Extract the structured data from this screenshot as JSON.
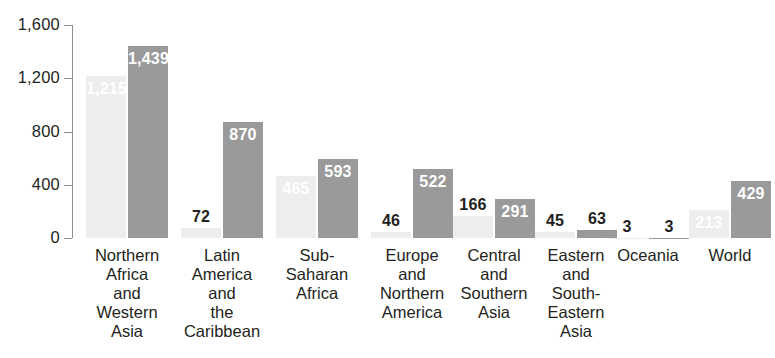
{
  "chart_data": {
    "type": "bar",
    "title": "",
    "subtitle": "",
    "xlabel": "",
    "ylabel": "",
    "ylim": [
      0,
      1600
    ],
    "yticks": [
      0,
      400,
      800,
      1200,
      1600
    ],
    "ytick_labels": [
      "0",
      "400",
      "800",
      "1,200",
      "1,600"
    ],
    "grid": false,
    "legend_position": "none",
    "categories": [
      "Northern Africa and Western Asia",
      "Latin America and the Caribbean",
      "Sub-Saharan Africa",
      "Europe and Northern America",
      "Central and Southern Asia",
      "Eastern and South-Eastern Asia",
      "Oceania",
      "World"
    ],
    "category_lines": [
      [
        "Northern",
        "Africa",
        "and",
        "Western",
        "Asia"
      ],
      [
        "Latin",
        "America",
        "and",
        "the",
        "Caribbean"
      ],
      [
        "Sub-",
        "Saharan",
        "Africa"
      ],
      [
        "Europe",
        "and",
        "Northern",
        "America"
      ],
      [
        "Central",
        "and",
        "Southern",
        "Asia"
      ],
      [
        "Eastern",
        "and",
        "South-",
        "Eastern",
        "Asia"
      ],
      [
        "Oceania"
      ],
      [
        "World"
      ]
    ],
    "series": [
      {
        "name": "series-1",
        "color": "#ededed",
        "values": [
          1215,
          72,
          465,
          46,
          166,
          45,
          3,
          213
        ],
        "labels": [
          "1,215",
          "72",
          "465",
          "46",
          "166",
          "45",
          "3",
          "213"
        ]
      },
      {
        "name": "series-2",
        "color": "#9a9a9a",
        "values": [
          1439,
          870,
          593,
          522,
          291,
          63,
          3,
          429
        ],
        "labels": [
          "1,439",
          "870",
          "593",
          "522",
          "291",
          "63",
          "3",
          "429"
        ]
      }
    ]
  },
  "colors": {
    "series_1": "#ededed",
    "series_2": "#9a9a9a",
    "axis": "#8d8d8d",
    "text": "#231f20",
    "inside_label": "#ffffff",
    "background": "#ffffff"
  }
}
